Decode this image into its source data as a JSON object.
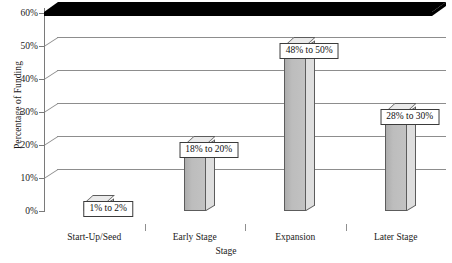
{
  "chart_data": {
    "type": "bar",
    "title": "",
    "xlabel": "Stage",
    "ylabel": "Percentage of Funding",
    "categories": [
      "Start-Up/Seed",
      "Early Stage",
      "Expansion",
      "Later Stage"
    ],
    "values": [
      2,
      20,
      50,
      30
    ],
    "value_labels": [
      "1% to 2%",
      "18% to 20%",
      "48% to 50%",
      "28% to 30%"
    ],
    "value_ranges": [
      {
        "low": 1,
        "high": 2
      },
      {
        "low": 18,
        "high": 20
      },
      {
        "low": 48,
        "high": 50
      },
      {
        "low": 28,
        "high": 30
      }
    ],
    "ylim": [
      0,
      60
    ],
    "ytick_values": [
      0,
      10,
      20,
      30,
      40,
      50,
      60
    ],
    "ytick_labels": [
      "0%",
      "10%",
      "20%",
      "30%",
      "40%",
      "50%",
      "60%"
    ],
    "grid": true,
    "legend": false,
    "style": "3d-column",
    "colors": {
      "bar_front": "#bdbdbd",
      "bar_side": "#dedede",
      "bar_top": "#eaeaea",
      "bar_edge": "#5c5c5c",
      "gridline": "#8d8d8d",
      "floor": "#000000",
      "text": "#1a1a1a",
      "background": "#ffffff"
    }
  }
}
